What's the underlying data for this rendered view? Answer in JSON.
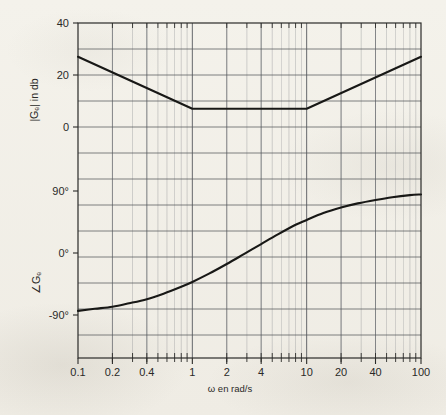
{
  "figure": {
    "kind": "bode-plot",
    "paper_color": "#f3f1ea",
    "ink_color": "#1c1c1a",
    "grid_color": "#8d8f92"
  },
  "axes": {
    "x_caption": "ω   en rad/s",
    "magnitude_axis_title": "|Gₑ| in db",
    "phase_axis_title": "∠Gₑ",
    "x_tick_labels": [
      "0.1",
      "0.2",
      "0.4",
      "1",
      "2",
      "4",
      "10",
      "20",
      "40",
      "100"
    ],
    "x_tick_values": [
      0.1,
      0.2,
      0.4,
      1,
      2,
      4,
      10,
      20,
      40,
      100
    ],
    "magnitude_tick_labels": [
      "40",
      "20",
      "0"
    ],
    "magnitude_tick_values": [
      40,
      20,
      0
    ],
    "phase_tick_labels": [
      "90°",
      "0°",
      "-90°"
    ],
    "phase_tick_values": [
      90,
      0,
      -90
    ]
  },
  "chart_data": {
    "type": "line",
    "title": "",
    "subtitle": "",
    "xlabel": "ω   en rad/s",
    "xscale": "log",
    "xlim": [
      0.1,
      100
    ],
    "grid": true,
    "legend": "none",
    "annotations": [],
    "panels": [
      {
        "name": "magnitude",
        "ylabel": "|Gₑ| in db",
        "ylim": [
          -12,
          40
        ],
        "ytick_values": [
          40,
          20,
          0
        ],
        "ytick_labels": [
          "40",
          "20",
          "0"
        ],
        "series": [
          {
            "name": "|G_c| asymptotic magnitude",
            "style": "piecewise-linear",
            "x": [
              0.1,
              1,
              10,
              100
            ],
            "values": [
              27,
              7,
              7,
              27
            ],
            "breakpoints": [
              {
                "omega": 1,
                "db": 7,
                "slope_before_db_per_decade": -20,
                "slope_after_db_per_decade": 0
              },
              {
                "omega": 10,
                "db": 7,
                "slope_before_db_per_decade": 0,
                "slope_after_db_per_decade": 20
              }
            ]
          }
        ]
      },
      {
        "name": "phase",
        "ylabel": "∠Gₑ",
        "ylim": [
          -135,
          120
        ],
        "ytick_values": [
          90,
          0,
          -90
        ],
        "ytick_labels": [
          "90°",
          "0°",
          "-90°"
        ],
        "series": [
          {
            "name": "∠G_c phase",
            "style": "smooth",
            "x": [
              0.1,
              0.14,
              0.2,
              0.28,
              0.4,
              0.56,
              0.8,
              1,
              1.4,
              2,
              2.8,
              4,
              5.6,
              8,
              10,
              14,
              20,
              28,
              40,
              56,
              80,
              100
            ],
            "values": [
              -84,
              -81,
              -78,
              -73,
              -67,
              -59,
              -49,
              -42,
              -30,
              -16,
              -2,
              13,
              27,
              41,
              48,
              58,
              66,
              72,
              77,
              81,
              84,
              85
            ]
          }
        ]
      }
    ]
  }
}
